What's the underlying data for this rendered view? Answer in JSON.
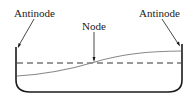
{
  "diagram": {
    "type": "standing-wave-seiche-in-basin",
    "labels": {
      "left_antinode": "Antinode",
      "node": "Node",
      "right_antinode": "Antinode"
    },
    "colors": {
      "outline": "#1a1a1a",
      "wave": "#8a8a8a",
      "dashed_level": "#333333",
      "background": "#ffffff"
    }
  }
}
